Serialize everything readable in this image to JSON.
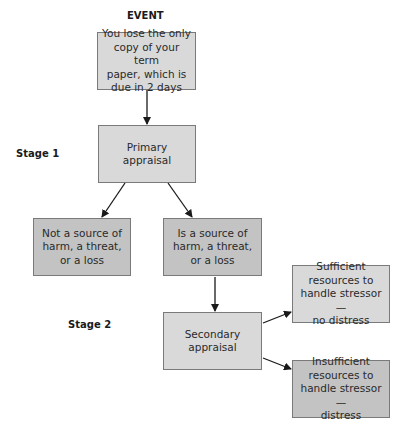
{
  "diagram": {
    "event_label": "EVENT",
    "stage1_label": "Stage 1",
    "stage2_label": "Stage 2",
    "nodes": {
      "event": "You lose the only\ncopy of your term\npaper, which is\ndue in 2 days",
      "primary": "Primary\nappraisal",
      "not_source": "Not a source of\nharm, a threat,\nor a loss",
      "is_source": "Is a source of\nharm, a threat,\nor a loss",
      "secondary": "Secondary\nappraisal",
      "sufficient": "Sufficient\nresources to\nhandle stressor—\nno distress",
      "insufficient": "Insufficient\nresources to\nhandle stressor—\ndistress"
    },
    "edges": [
      {
        "from": "event",
        "to": "primary"
      },
      {
        "from": "primary",
        "to": "not_source"
      },
      {
        "from": "primary",
        "to": "is_source"
      },
      {
        "from": "is_source",
        "to": "secondary"
      },
      {
        "from": "secondary",
        "to": "sufficient"
      },
      {
        "from": "secondary",
        "to": "insufficient"
      }
    ],
    "colors": {
      "light_fill": "#d9d9d9",
      "dark_fill": "#c3c3c3",
      "border": "#7a7a7a",
      "arrow": "#1a1a1a"
    }
  }
}
